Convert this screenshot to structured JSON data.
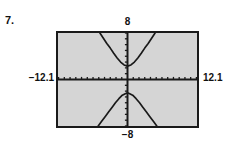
{
  "problem": {
    "number": "7."
  },
  "calculator": {
    "window": {
      "xmin_label": "−12.1",
      "xmax_label": "12.1",
      "ymax_label": "8",
      "ymin_label": "−8"
    },
    "colors": {
      "screen_background": "#d5d5d5",
      "ink": "#1a1a1a",
      "page_background": "#ffffff"
    }
  },
  "chart_data": {
    "type": "line",
    "title": "",
    "subtitle": "",
    "xlabel": "",
    "ylabel": "",
    "xlim": [
      -12.1,
      12.1
    ],
    "ylim": [
      -8,
      8
    ],
    "grid": false,
    "legend": null,
    "axis_ticks": {
      "x_tick_interval": 1,
      "y_tick_interval": 1,
      "x_tick_count": 24,
      "y_tick_count": 16,
      "tick_style": "short-marks-on-axis"
    },
    "annotations": [
      {
        "text": "8",
        "position": "above-screen-center"
      },
      {
        "text": "−8",
        "position": "below-screen-center"
      },
      {
        "text": "−12.1",
        "position": "left-of-screen"
      },
      {
        "text": "12.1",
        "position": "right-of-screen"
      }
    ],
    "series": [
      {
        "name": "upper branch",
        "comment": "vertical hyperbola upper branch, vertex near (0, 2.3)",
        "x": [
          -4.8,
          -4.2,
          -3.6,
          -3.0,
          -2.4,
          -1.8,
          -1.2,
          -0.6,
          0.0,
          0.6,
          1.2,
          1.8,
          2.4,
          3.0,
          3.6,
          4.2,
          4.8
        ],
        "y": [
          8.0,
          7.1,
          6.2,
          5.4,
          4.5,
          3.7,
          3.0,
          2.5,
          2.3,
          2.5,
          3.0,
          3.7,
          4.5,
          5.4,
          6.2,
          7.1,
          8.0
        ]
      },
      {
        "name": "lower branch",
        "comment": "vertical hyperbola lower branch, vertex near (0, -2.3)",
        "x": [
          -5.1,
          -4.5,
          -3.9,
          -3.3,
          -2.7,
          -2.1,
          -1.5,
          -0.9,
          -0.3,
          0.0,
          0.3,
          0.9,
          1.5,
          2.1,
          2.7,
          3.3,
          3.9,
          4.5,
          5.1
        ],
        "y": [
          -8.0,
          -7.2,
          -6.4,
          -5.6,
          -4.8,
          -4.0,
          -3.3,
          -2.7,
          -2.4,
          -2.3,
          -2.4,
          -2.7,
          -3.3,
          -4.0,
          -4.8,
          -5.6,
          -6.4,
          -7.2,
          -8.0
        ]
      }
    ]
  }
}
